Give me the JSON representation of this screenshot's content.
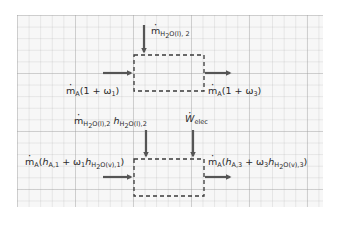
{
  "diagram": {
    "type": "control-volume energy/mass balance sketch on graph paper",
    "background": {
      "paper_color": "#f7f7f7",
      "grid_color": "#c8c8c8"
    },
    "colors": {
      "stroke": "#3a3a3a",
      "arrow": "#555555",
      "text": "#2b2b2b"
    },
    "top_system": {
      "name": "mass balance control volume",
      "inputs": [
        {
          "id": "water_in",
          "direction": "top",
          "symbol": "m",
          "sub": "H2O(l), 2",
          "label": "ṁH2O(l),2"
        },
        {
          "id": "air_in",
          "direction": "left",
          "symbol": "m",
          "sub": "A",
          "tail": "(1 + ω1)",
          "label": "ṁA(1 + ω1)"
        }
      ],
      "outputs": [
        {
          "id": "air_out",
          "direction": "right",
          "symbol": "m",
          "sub": "A",
          "tail": "(1 + ω3)",
          "label": "ṁA(1 + ω3)"
        }
      ]
    },
    "bottom_system": {
      "name": "energy balance control volume",
      "inputs": [
        {
          "id": "water_enthalpy_in",
          "direction": "top",
          "label": "ṁH2O(l),2 hH2O(l),2"
        },
        {
          "id": "electric_work",
          "direction": "top",
          "label": "Ẇelec"
        },
        {
          "id": "air_enthalpy_in",
          "direction": "left",
          "label": "ṁA(hA,1 + ω1hH2O(v),1)"
        }
      ],
      "outputs": [
        {
          "id": "air_enthalpy_out",
          "direction": "right",
          "label": "ṁA(hA,3 + ω3hH2O(v),3)"
        }
      ]
    }
  },
  "labels": {
    "top_water": {
      "m": "m",
      "sub": "H",
      "sub2": "2",
      "sub3": "O(l), 2"
    },
    "top_air_in": {
      "m": "m",
      "sub": "A",
      "body": "(1 + ω",
      "wsub": "1",
      "close": ")"
    },
    "top_air_out": {
      "m": "m",
      "sub": "A",
      "body": "(1 + ω",
      "wsub": "3",
      "close": ")"
    },
    "bot_water": {
      "m": "m",
      "msub": "H",
      "msub2": "2",
      "msub3": "O(l),2",
      "h": "h",
      "hsub": "H",
      "hsub2": "2",
      "hsub3": "O(l),2"
    },
    "bot_work": {
      "w": "W",
      "sub": "elec"
    },
    "bot_air_in": {
      "m": "m",
      "sub": "A",
      "open": "(",
      "h": "h",
      "hsub": "A,1",
      "plus": " + ω",
      "wsub": "1",
      "h2": "h",
      "h2sub": "H",
      "h2sub2": "2",
      "h2sub3": "O(v),1",
      "close": ")"
    },
    "bot_air_out": {
      "m": "m",
      "sub": "A",
      "open": "(",
      "h": "h",
      "hsub": "A,3",
      "plus": " + ω",
      "wsub": "3",
      "h2": "h",
      "h2sub": "H",
      "h2sub2": "2",
      "h2sub3": "O(v),3",
      "close": ")"
    }
  }
}
